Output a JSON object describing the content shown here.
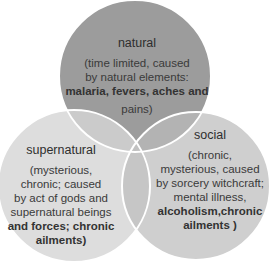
{
  "diagram": {
    "type": "venn",
    "colors": {
      "natural": "#9c9c9c",
      "supernatural": "#d6d6d6",
      "social": "#bdbdbd",
      "outline": "#ffffff"
    },
    "sets": [
      {
        "id": "natural",
        "title": "natural",
        "body_lines": [
          "(time limited, caused",
          "by natural elements:",
          "malaria, fevers, aches and",
          "pains)"
        ]
      },
      {
        "id": "supernatural",
        "title": "supernatural",
        "body_lines": [
          "(mysterious,",
          "chronic; caused",
          "by act of gods and",
          "supernatural beings",
          "and forces; chronic",
          "ailments)"
        ]
      },
      {
        "id": "social",
        "title": "social",
        "body_lines": [
          "(chronic,",
          "mysterious, caused",
          "by sorcery witchcraft;",
          "mental illness,",
          "alcoholism,chronic",
          "ailments )"
        ]
      }
    ]
  }
}
